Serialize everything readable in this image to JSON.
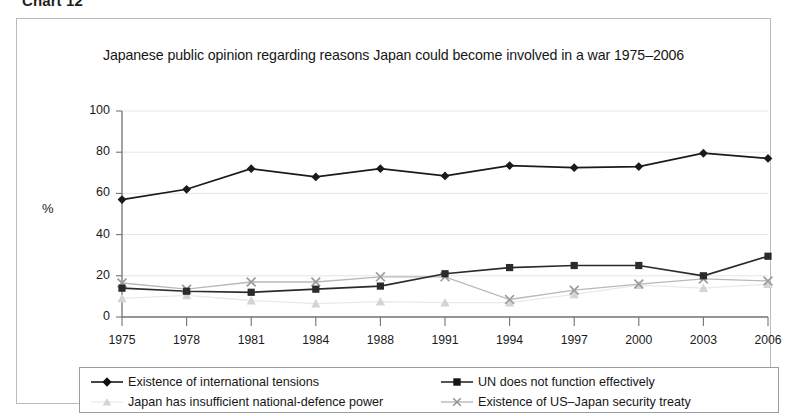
{
  "caption": "Chart 12",
  "chart_data": {
    "type": "line",
    "title": "Japanese public opinion regarding reasons Japan could become involved in a war 1975–2006",
    "xlabel": "",
    "ylabel": "%",
    "categories": [
      "1975",
      "1978",
      "1981",
      "1984",
      "1988",
      "1991",
      "1994",
      "1997",
      "2000",
      "2003",
      "2006"
    ],
    "ylim": [
      0,
      100
    ],
    "yticks": [
      0,
      20,
      40,
      60,
      80,
      100
    ],
    "grid": true,
    "legend_position": "bottom",
    "series": [
      {
        "name": "Existence of international tensions",
        "marker": "diamond",
        "color": "#1a1a1a",
        "values": [
          57,
          62,
          72,
          68,
          72,
          68.5,
          73.5,
          72.5,
          73,
          79.5,
          77
        ]
      },
      {
        "name": "UN does not function effectively",
        "marker": "square",
        "color": "#2b2b2b",
        "values": [
          14,
          12.5,
          12,
          13.5,
          15,
          21,
          24,
          25,
          25,
          20,
          29.5
        ]
      },
      {
        "name": "Japan has insufficient national-defence power",
        "marker": "triangle",
        "color": "#d2d4d5",
        "values": [
          9,
          10.5,
          8,
          6.5,
          7.5,
          7,
          7,
          11,
          15.5,
          14,
          16
        ]
      },
      {
        "name": "Existence of US–Japan security treaty",
        "marker": "cross",
        "color": "#9a9d9f",
        "values": [
          16.5,
          13.5,
          17,
          17,
          19.5,
          19.5,
          8.5,
          13,
          16,
          18.5,
          17.5
        ]
      }
    ]
  }
}
